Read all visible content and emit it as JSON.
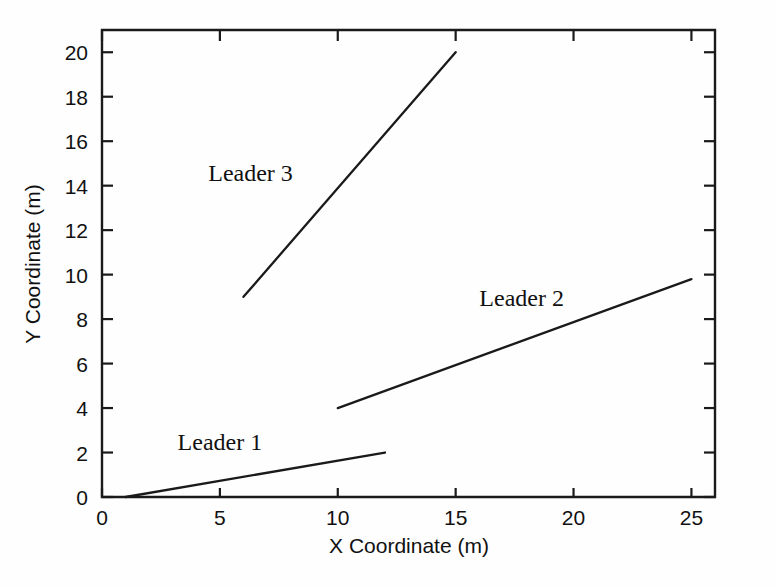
{
  "chart_data": {
    "type": "line",
    "title": "",
    "subtitle": "",
    "xlabel": "X Coordinate (m)",
    "ylabel": "Y Coordinate (m)",
    "xlim": [
      0,
      26
    ],
    "ylim": [
      0,
      21
    ],
    "xticks": [
      0,
      5,
      10,
      15,
      20,
      25
    ],
    "xtick_labels": [
      "0",
      "5",
      "10",
      "15",
      "20",
      "25"
    ],
    "yticks": [
      0,
      2,
      4,
      6,
      8,
      10,
      12,
      14,
      16,
      18,
      20
    ],
    "ytick_labels": [
      "0",
      "2",
      "4",
      "6",
      "8",
      "10",
      "12",
      "14",
      "16",
      "18",
      "20"
    ],
    "grid": false,
    "legend_position": "inline-annotations",
    "line_color": "#1a1a1a",
    "background_color": "#fefefe",
    "series": [
      {
        "name": "Leader 1",
        "label": "Leader 1",
        "label_x": 5.0,
        "label_y": 2.1,
        "x": [
          1,
          12
        ],
        "y": [
          0,
          2
        ]
      },
      {
        "name": "Leader 2",
        "label": "Leader 2",
        "label_x": 17.8,
        "label_y": 8.6,
        "x": [
          10,
          25
        ],
        "y": [
          4,
          9.8
        ]
      },
      {
        "name": "Leader 3",
        "label": "Leader 3",
        "label_x": 6.3,
        "label_y": 14.2,
        "x": [
          6,
          15
        ],
        "y": [
          9,
          20
        ]
      }
    ]
  },
  "axes": {
    "x_title": "X Coordinate (m)",
    "y_title": "Y Coordinate (m)"
  }
}
